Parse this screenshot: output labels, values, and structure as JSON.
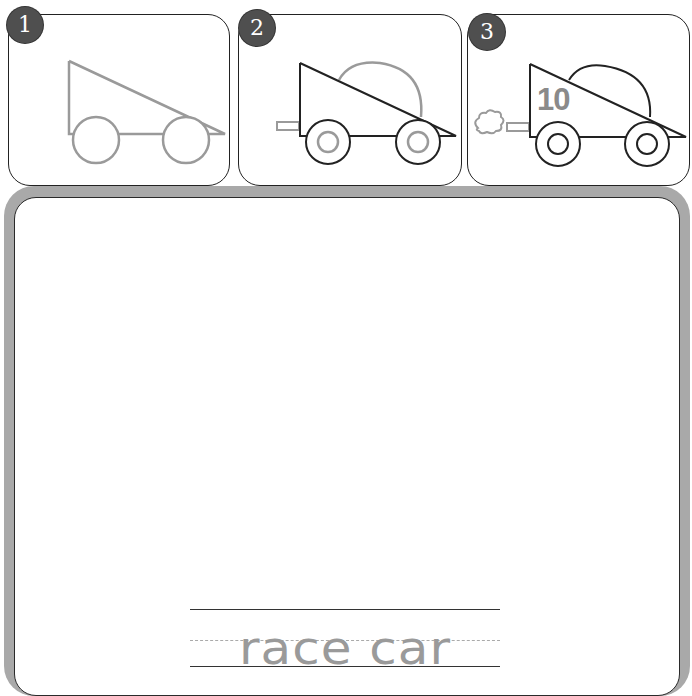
{
  "title_fragment": "",
  "steps": [
    {
      "number": "1",
      "description": "Triangle body with two circle wheels"
    },
    {
      "number": "2",
      "description": "Add cockpit dome, exhaust pipe and inner hubcaps"
    },
    {
      "number": "3",
      "description": "Add race number and exhaust puff",
      "car_number": "10"
    }
  ],
  "tracing": {
    "word": "race car"
  },
  "colors": {
    "badge": "#4f4f4f",
    "frame": "#a9a9a9",
    "outline_step1": "#999999",
    "outline_final": "#222222",
    "trace_text": "#9a9a9a"
  }
}
